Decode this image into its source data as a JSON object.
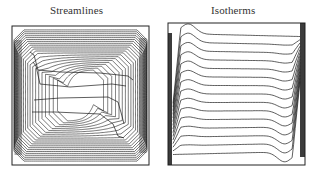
{
  "figure": {
    "panels": [
      {
        "id": "streamlines",
        "title": "Streamlines",
        "box": {
          "x": 12,
          "y": 26,
          "w": 137,
          "h": 139
        },
        "contour_count_outer": 22,
        "contour_count_inner": 4,
        "wall_density": "high"
      },
      {
        "id": "isotherms",
        "title": "Isotherms",
        "box": {
          "x": 168,
          "y": 23,
          "w": 137,
          "h": 142
        },
        "contour_count": 15,
        "wall_density": "high"
      }
    ],
    "colors": {
      "line": "#1a1a1a",
      "background": "#ffffff",
      "frame": "#222222"
    }
  }
}
